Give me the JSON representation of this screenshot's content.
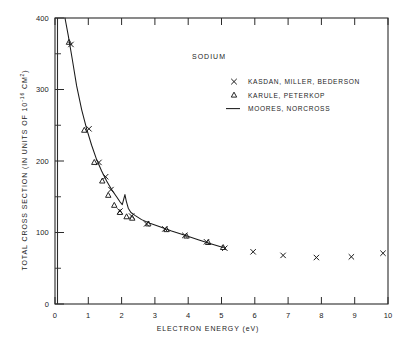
{
  "chart_data": {
    "type": "scatter",
    "title": "SODIUM",
    "xlabel": "ELECTRON ENERGY  (eV)",
    "ylabel_main": "TOTAL CROSS SECTION (IN UNITS OF 10",
    "ylabel_exp": "-16",
    "ylabel_tail": " CM",
    "ylabel_exp2": "2",
    "ylabel_close": ")",
    "xlim": [
      0,
      10
    ],
    "ylim": [
      0,
      400
    ],
    "xticks": [
      0,
      1,
      2,
      3,
      4,
      5,
      6,
      7,
      8,
      9,
      10
    ],
    "xticklabels": [
      "0",
      "1",
      "2",
      "3",
      "4",
      "5",
      "6",
      "7",
      "8",
      "9",
      "10"
    ],
    "yticks": [
      0,
      100,
      200,
      300,
      400
    ],
    "yticklabels": [
      "0",
      "100",
      "200",
      "300",
      "400"
    ],
    "yticks_minor": [
      50,
      150,
      250,
      350
    ],
    "grid": false,
    "legend_position": "upper-right-inside",
    "series": [
      {
        "name": "KASDAN, MILLER, BEDERSON",
        "marker": "x",
        "points": [
          [
            0.48,
            363
          ],
          [
            1.02,
            245
          ],
          [
            1.32,
            198
          ],
          [
            1.52,
            178
          ],
          [
            1.68,
            160
          ],
          [
            1.95,
            130
          ],
          [
            2.3,
            123
          ],
          [
            2.75,
            112
          ],
          [
            3.3,
            105
          ],
          [
            3.9,
            96
          ],
          [
            4.55,
            87
          ],
          [
            5.1,
            78
          ],
          [
            5.95,
            73
          ],
          [
            6.85,
            68
          ],
          [
            7.85,
            65
          ],
          [
            8.9,
            66
          ],
          [
            9.85,
            71
          ]
        ]
      },
      {
        "name": "KARULE, PETERKOP",
        "marker": "triangle",
        "points": [
          [
            0.42,
            366
          ],
          [
            0.88,
            243
          ],
          [
            1.18,
            198
          ],
          [
            1.42,
            172
          ],
          [
            1.6,
            152
          ],
          [
            1.78,
            138
          ],
          [
            1.95,
            128
          ],
          [
            2.15,
            122
          ],
          [
            2.32,
            120
          ],
          [
            2.8,
            112
          ],
          [
            3.35,
            104
          ],
          [
            3.95,
            95
          ],
          [
            4.6,
            86
          ],
          [
            5.05,
            79
          ]
        ]
      },
      {
        "name": "MOORES, NORCROSS",
        "marker": "line",
        "points": [
          [
            0.3,
            400
          ],
          [
            0.4,
            375
          ],
          [
            0.52,
            342
          ],
          [
            0.65,
            305
          ],
          [
            0.8,
            272
          ],
          [
            0.95,
            245
          ],
          [
            1.1,
            222
          ],
          [
            1.25,
            202
          ],
          [
            1.4,
            186
          ],
          [
            1.55,
            172
          ],
          [
            1.7,
            160
          ],
          [
            1.85,
            150
          ],
          [
            1.95,
            143
          ],
          [
            2.02,
            139
          ],
          [
            2.06,
            146
          ],
          [
            2.1,
            153
          ],
          [
            2.14,
            144
          ],
          [
            2.2,
            134
          ],
          [
            2.28,
            128
          ],
          [
            2.4,
            124
          ],
          [
            2.6,
            118
          ],
          [
            2.85,
            113
          ],
          [
            3.15,
            108
          ],
          [
            3.5,
            102
          ],
          [
            3.9,
            96
          ],
          [
            4.3,
            90
          ],
          [
            4.7,
            84
          ],
          [
            5.05,
            79
          ]
        ]
      }
    ]
  }
}
